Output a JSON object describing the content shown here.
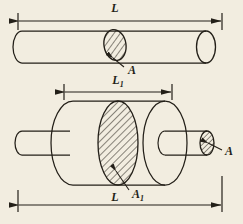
{
  "figure": {
    "background_color": "#f2ede0",
    "line_color": "#231f18",
    "hatch_color": "#231f18"
  },
  "top_view": {
    "name": "uniform-rod",
    "dimension_length": {
      "label": "L",
      "position": "above",
      "arrow_style": "double-headed-with-ticks"
    },
    "cross_section": {
      "label": "A",
      "hatched": true,
      "location": "mid-rod"
    },
    "end_face": {
      "label": "",
      "hatched": false,
      "location": "right-end"
    }
  },
  "bottom_view": {
    "name": "stepped-shaft",
    "dimension_inner": {
      "label": "L",
      "subscript": "1",
      "position": "above",
      "arrow_style": "double-headed-with-ticks"
    },
    "dimension_total": {
      "label": "L",
      "position": "below",
      "arrow_style": "double-headed-with-ticks"
    },
    "cross_section_large": {
      "label": "A",
      "subscript": "1",
      "hatched": true,
      "location": "center-of-thick-cylinder"
    },
    "cross_section_small": {
      "label": "A",
      "hatched": true,
      "location": "right-rod-end"
    }
  }
}
